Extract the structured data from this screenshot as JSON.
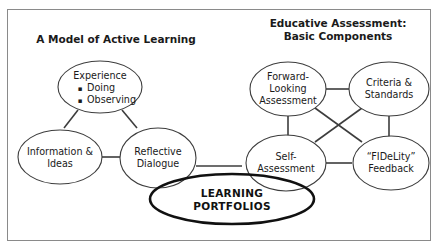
{
  "figure": {
    "frame": {
      "border_color": "#8a8a8a",
      "background": "#ffffff"
    },
    "headings": {
      "left": "A Model of Active Learning",
      "right_line1": "Educative Assessment:",
      "right_line2": "Basic Components"
    },
    "left_model": {
      "experience": {
        "label": "Experience",
        "bullets": [
          "Doing",
          "Observing"
        ],
        "bullet_glyph": "▪"
      },
      "information": {
        "line1": "Information &",
        "line2": "Ideas"
      },
      "reflective": {
        "line1": "Reflective",
        "line2": "Dialogue"
      }
    },
    "right_model": {
      "forward_looking": {
        "line1": "Forward-",
        "line2": "Looking",
        "line3": "Assessment"
      },
      "criteria": {
        "line1": "Criteria &",
        "line2": "Standards"
      },
      "self_assessment": {
        "line1": "Self-",
        "line2": "Assessment"
      },
      "fidelity": {
        "line1": "“FIDeLity”",
        "line2": "Feedback"
      }
    },
    "center": {
      "line1": "LEARNING",
      "line2": "PORTFOLIOS",
      "stroke_color": "#111111"
    },
    "colors": {
      "node_stroke": "#3d3d3d",
      "connector": "#3d3d3d",
      "text": "#1a1a1a",
      "emphasis": "#111111"
    }
  }
}
